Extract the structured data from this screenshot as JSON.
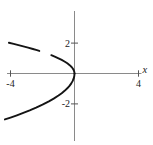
{
  "chart_data": {
    "type": "line",
    "title": "",
    "xlabel": "x",
    "ylabel": "",
    "x_ticks": [
      -4,
      4
    ],
    "y_ticks": [
      2,
      -2
    ],
    "xlim": [
      -4.16,
      4.16
    ],
    "ylim": [
      -4.44,
      4.11
    ],
    "grid": false,
    "legend": null,
    "curve_color": "#141414",
    "axis_color": "#8a8a8a",
    "tick_color": "#555555",
    "label_color": "#222222",
    "series": [
      {
        "name": "upper-branch-left-piece",
        "points": [
          [
            -4.1,
            2.025
          ],
          [
            -3.8,
            1.949
          ],
          [
            -3.5,
            1.871
          ],
          [
            -3.2,
            1.789
          ],
          [
            -2.9,
            1.703
          ],
          [
            -2.6,
            1.612
          ],
          [
            -2.4,
            1.549
          ],
          [
            -2.2,
            1.483
          ]
        ]
      },
      {
        "name": "upper-branch-right-piece",
        "points": [
          [
            -1.45,
            1.204
          ],
          [
            -1.2,
            1.095
          ],
          [
            -1.0,
            1.0
          ],
          [
            -0.8,
            0.894
          ],
          [
            -0.6,
            0.775
          ],
          [
            -0.45,
            0.671
          ],
          [
            -0.3,
            0.548
          ],
          [
            -0.2,
            0.447
          ],
          [
            -0.12,
            0.346
          ],
          [
            -0.05,
            0.224
          ],
          [
            -0.01,
            0.1
          ],
          [
            0.0,
            0.0
          ]
        ]
      },
      {
        "name": "lower-branch",
        "points": [
          [
            0.0,
            0.0
          ],
          [
            -0.01,
            -0.145
          ],
          [
            -0.05,
            -0.324
          ],
          [
            -0.12,
            -0.502
          ],
          [
            -0.2,
            -0.648
          ],
          [
            -0.3,
            -0.794
          ],
          [
            -0.45,
            -0.973
          ],
          [
            -0.6,
            -1.123
          ],
          [
            -0.8,
            -1.297
          ],
          [
            -1.0,
            -1.45
          ],
          [
            -1.3,
            -1.653
          ],
          [
            -1.6,
            -1.834
          ],
          [
            -2.0,
            -2.051
          ],
          [
            -2.4,
            -2.246
          ],
          [
            -2.8,
            -2.426
          ],
          [
            -3.2,
            -2.594
          ],
          [
            -3.6,
            -2.751
          ],
          [
            -4.0,
            -2.9
          ],
          [
            -4.35,
            -3.024
          ]
        ]
      }
    ]
  }
}
